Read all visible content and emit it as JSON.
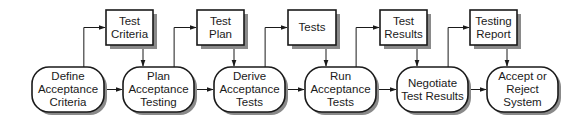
{
  "diagram": {
    "type": "process-flow",
    "processes": [
      {
        "id": "define",
        "label": "Define\nAcceptance\nCriteria",
        "x": 32,
        "y": 67,
        "w": 72,
        "h": 45
      },
      {
        "id": "plan",
        "label": "Plan\nAcceptance\nTesting",
        "x": 123,
        "y": 67,
        "w": 71,
        "h": 45
      },
      {
        "id": "derive",
        "label": "Derive\nAcceptance\nTests",
        "x": 214,
        "y": 67,
        "w": 71,
        "h": 45
      },
      {
        "id": "run",
        "label": "Run\nAcceptance\nTests",
        "x": 305,
        "y": 67,
        "w": 71,
        "h": 45
      },
      {
        "id": "negotiate",
        "label": "Negotiate\nTest Results",
        "x": 397,
        "y": 67,
        "w": 71,
        "h": 45
      },
      {
        "id": "accept",
        "label": "Accept or\nReject\nSystem",
        "x": 487,
        "y": 67,
        "w": 71,
        "h": 45
      }
    ],
    "artifacts": [
      {
        "id": "test-criteria",
        "label": "Test\nCriteria",
        "x": 106,
        "y": 10,
        "w": 47,
        "h": 35
      },
      {
        "id": "test-plan",
        "label": "Test\nPlan",
        "x": 197,
        "y": 10,
        "w": 47,
        "h": 35
      },
      {
        "id": "tests",
        "label": "Tests",
        "x": 288,
        "y": 10,
        "w": 48,
        "h": 35
      },
      {
        "id": "test-results",
        "label": "Test\nResults",
        "x": 380,
        "y": 10,
        "w": 47,
        "h": 35
      },
      {
        "id": "testing-report",
        "label": "Testing\nReport",
        "x": 470,
        "y": 10,
        "w": 47,
        "h": 35
      }
    ],
    "edges": [
      {
        "from": "define",
        "to": "plan"
      },
      {
        "from": "plan",
        "to": "derive"
      },
      {
        "from": "derive",
        "to": "run"
      },
      {
        "from": "run",
        "to": "negotiate"
      },
      {
        "from": "negotiate",
        "to": "accept"
      },
      {
        "from": "define",
        "to": "test-criteria"
      },
      {
        "from": "test-criteria",
        "to": "plan"
      },
      {
        "from": "plan",
        "to": "test-plan"
      },
      {
        "from": "test-plan",
        "to": "derive"
      },
      {
        "from": "derive",
        "to": "tests"
      },
      {
        "from": "tests",
        "to": "run"
      },
      {
        "from": "run",
        "to": "test-results"
      },
      {
        "from": "test-results",
        "to": "negotiate"
      },
      {
        "from": "negotiate",
        "to": "testing-report"
      },
      {
        "from": "testing-report",
        "to": "accept"
      }
    ],
    "colors": {
      "stroke": "#1a1a1a",
      "fill": "#ffffff",
      "shadow": "#8a8a8a"
    }
  }
}
